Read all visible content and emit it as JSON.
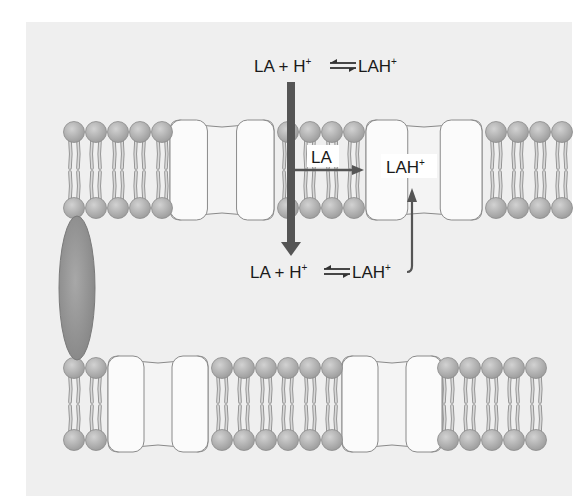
{
  "diagram": {
    "colors": {
      "background": "#efefef",
      "lipid_head": "#a9a9a9",
      "lipid_head_edge": "#8c8c8c",
      "lipid_tail": "#d8d8d8",
      "channel_fill": "#fbfbfb",
      "channel_edge": "#8a8a8a",
      "arrow": "#505050",
      "protein": "#8f8f8f"
    },
    "labels": {
      "top_equation": {
        "lhs": "LA + H",
        "lhs_sup": "+",
        "rhs": "LAH",
        "rhs_sup": "+"
      },
      "bottom_equation": {
        "lhs": "LA + H",
        "lhs_sup": "+",
        "rhs": "LAH",
        "rhs_sup": "+"
      },
      "membrane_la": "LA",
      "channel_lah": {
        "text": "LAH",
        "sup": "+"
      }
    },
    "membranes": [
      {
        "name": "upper-membrane",
        "lipid_groups": [
          {
            "x": [
              74,
              96,
              118,
              140,
              162
            ]
          },
          {
            "x": [
              288,
              310,
              332,
              354
            ]
          },
          {
            "x": [
              496,
              518,
              540,
              562
            ]
          }
        ],
        "channels": [
          {
            "x": 170,
            "width": 104
          },
          {
            "x": 366,
            "width": 116
          }
        ]
      },
      {
        "name": "lower-membrane",
        "lipid_groups": [
          {
            "x": [
              74,
              96
            ]
          },
          {
            "x": [
              222,
              244,
              266,
              288,
              310,
              332
            ]
          },
          {
            "x": [
              448,
              470,
              492,
              514,
              536
            ]
          }
        ],
        "channels": [
          {
            "x": 108,
            "width": 100
          },
          {
            "x": 342,
            "width": 100
          }
        ]
      }
    ]
  }
}
